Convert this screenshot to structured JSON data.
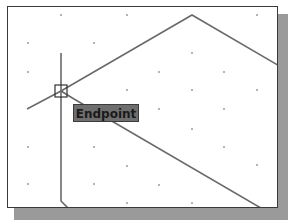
{
  "drawing_area": {
    "background": "#ffffff",
    "grid_dot_color": "#555555",
    "line_color": "#6a6a6a"
  },
  "osnap": {
    "marker": "endpoint-square",
    "tooltip_label": "Endpoint",
    "tooltip_bg": "#6e6e6e"
  }
}
